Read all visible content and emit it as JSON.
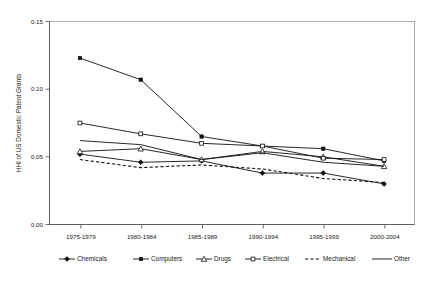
{
  "chart_data": {
    "type": "line",
    "title": "",
    "xlabel": "",
    "ylabel": "HHI of US Domestic Patent Grants",
    "categories": [
      "1975-1979",
      "1980-1984",
      "1985-1989",
      "1990-1994",
      "1995-1999",
      "2000-2004"
    ],
    "ylim": [
      0.0,
      0.15
    ],
    "ytick_labels": [
      "0.00",
      "0.05",
      "0.10",
      "0.15"
    ],
    "ytick_values": [
      0.0,
      0.05,
      0.1,
      0.15
    ],
    "grid": false,
    "legend_position": "bottom",
    "series": [
      {
        "name": "Chemicals",
        "marker": "filled-diamond",
        "linestyle": "solid",
        "values": [
          0.052,
          0.046,
          0.047,
          0.038,
          0.038,
          0.03
        ]
      },
      {
        "name": "Computers",
        "marker": "filled-square",
        "linestyle": "solid",
        "values": [
          0.123,
          0.107,
          0.065,
          0.058,
          0.056,
          0.047
        ]
      },
      {
        "name": "Drugs",
        "marker": "open-triangle",
        "linestyle": "solid",
        "values": [
          0.054,
          0.056,
          0.048,
          0.054,
          0.05,
          0.043
        ]
      },
      {
        "name": "Electrical",
        "marker": "open-square",
        "linestyle": "solid",
        "values": [
          0.075,
          0.067,
          0.06,
          0.058,
          0.049,
          0.048
        ]
      },
      {
        "name": "Mechanical",
        "marker": "none",
        "linestyle": "dashed",
        "values": [
          0.048,
          0.042,
          0.044,
          0.041,
          0.034,
          0.031
        ]
      },
      {
        "name": "Other",
        "marker": "none",
        "linestyle": "solid",
        "values": [
          0.062,
          0.059,
          0.048,
          0.053,
          0.046,
          0.043
        ]
      }
    ]
  },
  "legend": {
    "entries": [
      {
        "label": "Chemicals"
      },
      {
        "label": "Computers"
      },
      {
        "label": "Drugs"
      },
      {
        "label": "Electrical"
      },
      {
        "label": "Mechanical"
      },
      {
        "label": "Other"
      }
    ]
  },
  "colors": {
    "series": "#111111",
    "axis": "#4a4a4a",
    "frame": "#8e8e8e",
    "background": "#ffffff",
    "text": "#1a1a1a"
  }
}
